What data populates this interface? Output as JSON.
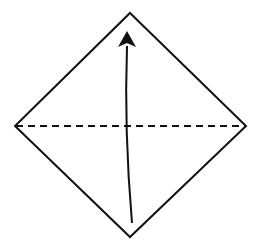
{
  "diagram": {
    "type": "origami-step",
    "colors": {
      "line": "#111111",
      "background": "#ffffff"
    },
    "shape": {
      "vertices": {
        "top": [
          130,
          13
        ],
        "right": [
          246,
          126
        ],
        "bottom": [
          130,
          237
        ],
        "left": [
          15,
          126
        ]
      }
    },
    "fold_line": {
      "style": "dashed",
      "from": [
        15,
        126
      ],
      "to": [
        246,
        126
      ]
    },
    "arrow": {
      "from": [
        132,
        223
      ],
      "to": [
        127,
        31
      ],
      "direction": "up"
    }
  }
}
